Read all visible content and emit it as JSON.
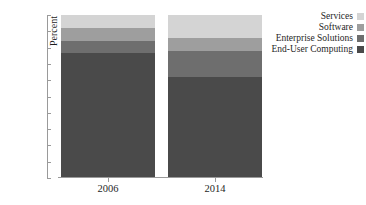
{
  "chart_data": {
    "type": "bar",
    "stacked": true,
    "normalized": "100% stacked",
    "title": "",
    "xlabel": "",
    "ylabel": "Percent",
    "categories": [
      "2006",
      "2014"
    ],
    "ylim": [
      0,
      100
    ],
    "ytick_labels": [
      "100%",
      "90%",
      "80%",
      "70%",
      "60%",
      "50%",
      "40%",
      "30%",
      "20%",
      "10%",
      "0%"
    ],
    "ytick_values": [
      100,
      90,
      80,
      70,
      60,
      50,
      40,
      30,
      20,
      10,
      0
    ],
    "grid": false,
    "legend_position": "top-right",
    "stack_order_bottom_to_top": [
      "End-User Computing",
      "Enterprise Solutions",
      "Software",
      "Services"
    ],
    "series": [
      {
        "name": "Services",
        "color": "#d4d4d4",
        "values": [
          8,
          14
        ]
      },
      {
        "name": "Software",
        "color": "#9e9e9e",
        "values": [
          8,
          8
        ]
      },
      {
        "name": "Enterprise Solutions",
        "color": "#6e6e6e",
        "values": [
          7,
          16
        ]
      },
      {
        "name": "End-User Computing",
        "color": "#4a4a4a",
        "values": [
          77,
          62
        ]
      }
    ]
  },
  "axis": {
    "y_title": "Percent"
  },
  "legend": {
    "items": [
      {
        "label": "Services",
        "color": "#d4d4d4"
      },
      {
        "label": "Software",
        "color": "#9e9e9e"
      },
      {
        "label": "Enterprise Solutions",
        "color": "#6e6e6e"
      },
      {
        "label": "End-User Computing",
        "color": "#4a4a4a"
      }
    ]
  }
}
